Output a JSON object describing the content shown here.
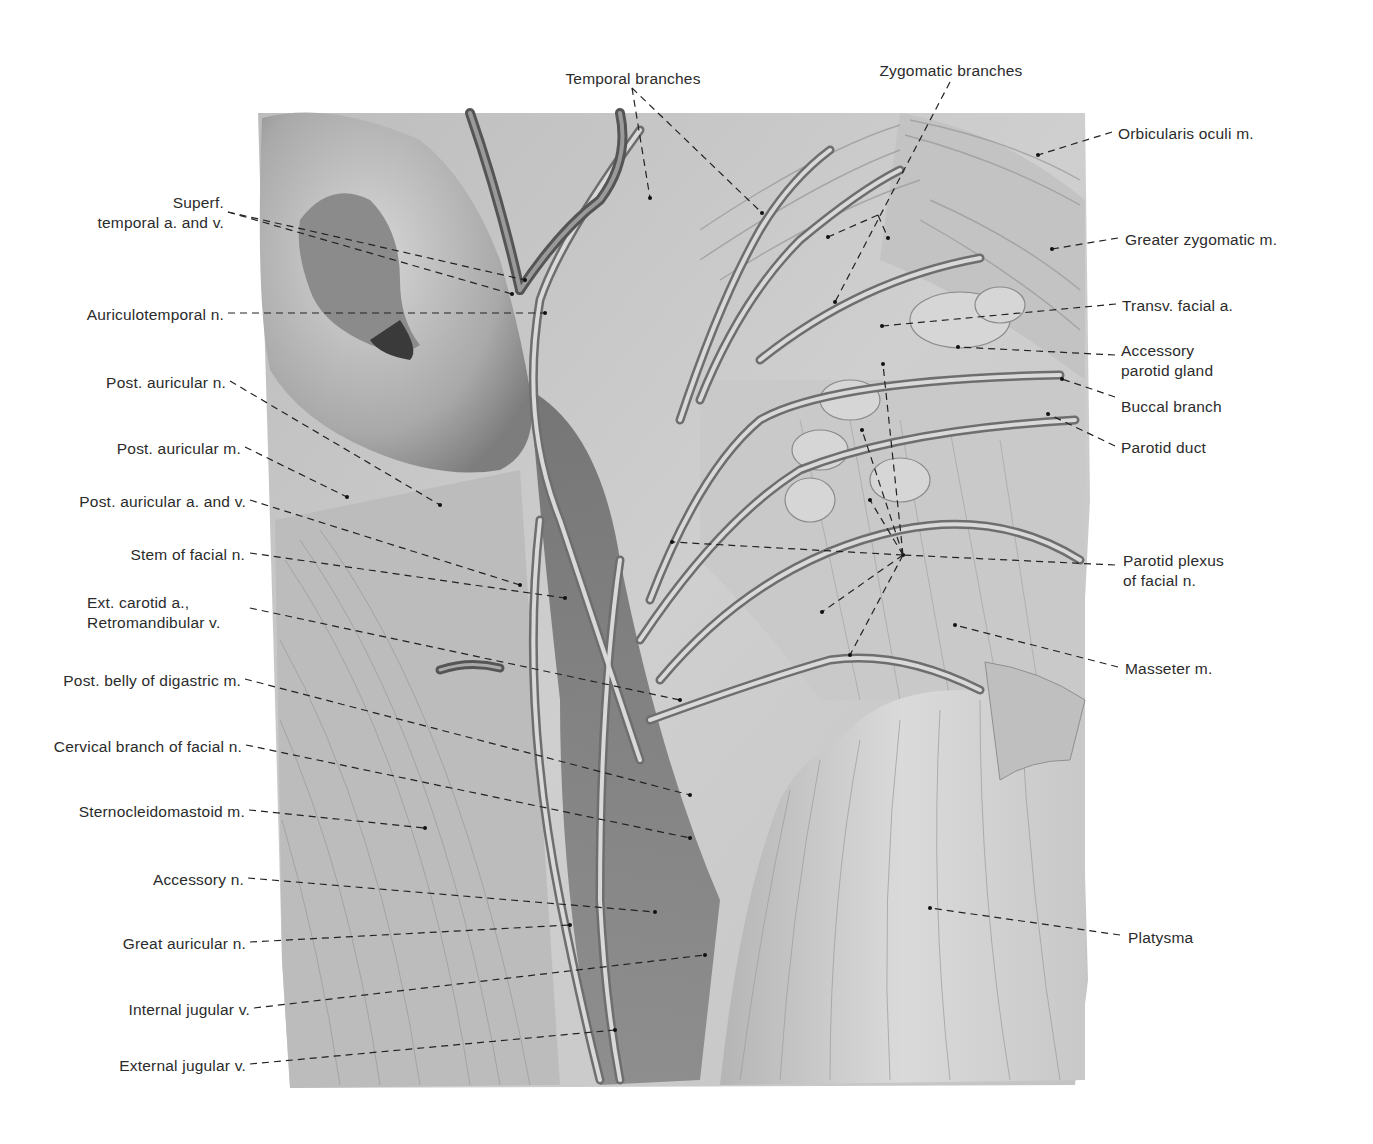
{
  "figure": {
    "labels_left": [
      {
        "id": "superf-temporal",
        "lines": [
          "Superf.",
          "temporal a. and v."
        ],
        "x": 224,
        "y": 193
      },
      {
        "id": "auriculotemporal",
        "lines": [
          "Auriculotemporal n."
        ],
        "x": 224,
        "y": 305
      },
      {
        "id": "post-auricular-n",
        "lines": [
          "Post. auricular n."
        ],
        "x": 226,
        "y": 373
      },
      {
        "id": "post-auricular-m",
        "lines": [
          "Post. auricular m."
        ],
        "x": 241,
        "y": 439
      },
      {
        "id": "post-auricular-av",
        "lines": [
          "Post. auricular a. and v."
        ],
        "x": 246,
        "y": 492
      },
      {
        "id": "stem-facial",
        "lines": [
          "Stem of facial n."
        ],
        "x": 245,
        "y": 545
      },
      {
        "id": "ext-carotid",
        "lines": [
          "Ext. carotid a.,",
          "Retromandibular v."
        ],
        "x": 248,
        "y": 593
      },
      {
        "id": "post-belly-digastric",
        "lines": [
          "Post. belly of digastric m."
        ],
        "x": 241,
        "y": 671
      },
      {
        "id": "cervical-branch",
        "lines": [
          "Cervical branch of facial n."
        ],
        "x": 242,
        "y": 737
      },
      {
        "id": "sternocleidomastoid",
        "lines": [
          "Sternocleidomastoid m."
        ],
        "x": 245,
        "y": 802
      },
      {
        "id": "accessory-n",
        "lines": [
          "Accessory n."
        ],
        "x": 244,
        "y": 870
      },
      {
        "id": "great-auricular",
        "lines": [
          "Great auricular n."
        ],
        "x": 246,
        "y": 934
      },
      {
        "id": "internal-jugular",
        "lines": [
          "Internal jugular v."
        ],
        "x": 250,
        "y": 1000
      },
      {
        "id": "external-jugular",
        "lines": [
          "External jugular v."
        ],
        "x": 246,
        "y": 1056
      }
    ],
    "labels_right": [
      {
        "id": "orbicularis-oculi",
        "lines": [
          "Orbicularis oculi m."
        ],
        "x": 1118,
        "y": 124
      },
      {
        "id": "greater-zygomatic",
        "lines": [
          "Greater zygomatic m."
        ],
        "x": 1125,
        "y": 230
      },
      {
        "id": "transv-facial",
        "lines": [
          "Transv. facial a."
        ],
        "x": 1122,
        "y": 296
      },
      {
        "id": "accessory-parotid",
        "lines": [
          "Accessory",
          "parotid gland"
        ],
        "x": 1121,
        "y": 341
      },
      {
        "id": "buccal-branch",
        "lines": [
          "Buccal branch"
        ],
        "x": 1121,
        "y": 397
      },
      {
        "id": "parotid-duct",
        "lines": [
          "Parotid duct"
        ],
        "x": 1121,
        "y": 438
      },
      {
        "id": "parotid-plexus",
        "lines": [
          "Parotid plexus",
          "of facial n."
        ],
        "x": 1123,
        "y": 551
      },
      {
        "id": "masseter",
        "lines": [
          "Masseter m."
        ],
        "x": 1125,
        "y": 659
      },
      {
        "id": "platysma",
        "lines": [
          "Platysma"
        ],
        "x": 1128,
        "y": 928
      }
    ],
    "labels_top": [
      {
        "id": "temporal-branches",
        "lines": [
          "Temporal branches"
        ],
        "x": 633,
        "y": 69
      },
      {
        "id": "zygomatic-branches",
        "lines": [
          "Zygomatic branches"
        ],
        "x": 951,
        "y": 61
      }
    ]
  }
}
